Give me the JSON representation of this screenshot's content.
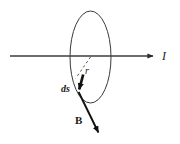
{
  "figure": {
    "background_color": "#ffffff",
    "stroke_color": "#333333",
    "label_color": "#1a1a1a",
    "width": 180,
    "height": 144
  },
  "labels": {
    "current": "I",
    "radius": "r",
    "line_element": "ds",
    "magnetic_field": "B"
  },
  "elements": {
    "loop": {
      "name": "amperian-loop",
      "shape": "ellipse",
      "center_x": 90.5,
      "center_y": 57,
      "radius_x": 20.5,
      "radius_y": 46,
      "stroke_width": 1
    },
    "wire": {
      "name": "current-wire",
      "shape": "line-with-arrow",
      "x1": 10,
      "y1": 56,
      "x2": 156,
      "y2": 56,
      "stroke_width": 1.4
    },
    "radius_line": {
      "name": "radius-dashed-line",
      "shape": "dashed-line",
      "x1": 90.5,
      "y1": 57,
      "x2": 75.5,
      "y2": 78.5,
      "dash": "2.5 2.5",
      "stroke_width": 1
    },
    "ds_vector": {
      "name": "ds-vector",
      "shape": "arrow",
      "x1": 83,
      "y1": 75,
      "x2": 78.5,
      "y2": 92,
      "stroke_width": 2.6
    },
    "b_vector": {
      "name": "b-field-vector",
      "shape": "arrow",
      "x1": 78.5,
      "y1": 92,
      "x2": 100,
      "y2": 136,
      "stroke_width": 1.8
    }
  }
}
